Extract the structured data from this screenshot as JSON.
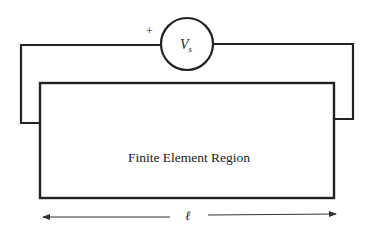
{
  "diagram": {
    "source_label": "V",
    "source_subscript": "s",
    "polarity": "+",
    "region_label": "Finite Element Region",
    "length_label": "ℓ",
    "colors": {
      "stroke": "#222222",
      "background": "#ffffff"
    }
  }
}
